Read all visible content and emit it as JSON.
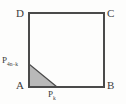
{
  "figure": {
    "type": "geometry-diagram",
    "background_color": "#fdfdfc",
    "stroke_color": "#4a4a4a",
    "shaded_fill_color": "#b9b9b9",
    "shaded_stroke_color": "#4a4a4a",
    "text_color": "#3c3c3c",
    "square": {
      "name": "square-ABCD",
      "left": 29,
      "top": 13,
      "right": 104,
      "bottom": 87,
      "stroke_width": 1.4
    },
    "vertices": [
      {
        "id": "D",
        "label": "D",
        "x": 29,
        "y": 13
      },
      {
        "id": "C",
        "label": "C",
        "x": 104,
        "y": 13
      },
      {
        "id": "A",
        "label": "A",
        "x": 29,
        "y": 87
      },
      {
        "id": "B",
        "label": "B",
        "x": 104,
        "y": 87
      }
    ],
    "marked_points": [
      {
        "id": "P-left",
        "base": "P",
        "subscript": "4n−k",
        "x": 29,
        "y": 64,
        "on_edge": "AD"
      },
      {
        "id": "P-bottom",
        "base": "P",
        "subscript": "k",
        "x": 57,
        "y": 87,
        "on_edge": "AB"
      }
    ],
    "shaded_triangle": {
      "name": "shaded-triangle",
      "points": "29,64 29,87 57,87",
      "vertex_ids": [
        "P-left",
        "A",
        "P-bottom"
      ]
    }
  }
}
